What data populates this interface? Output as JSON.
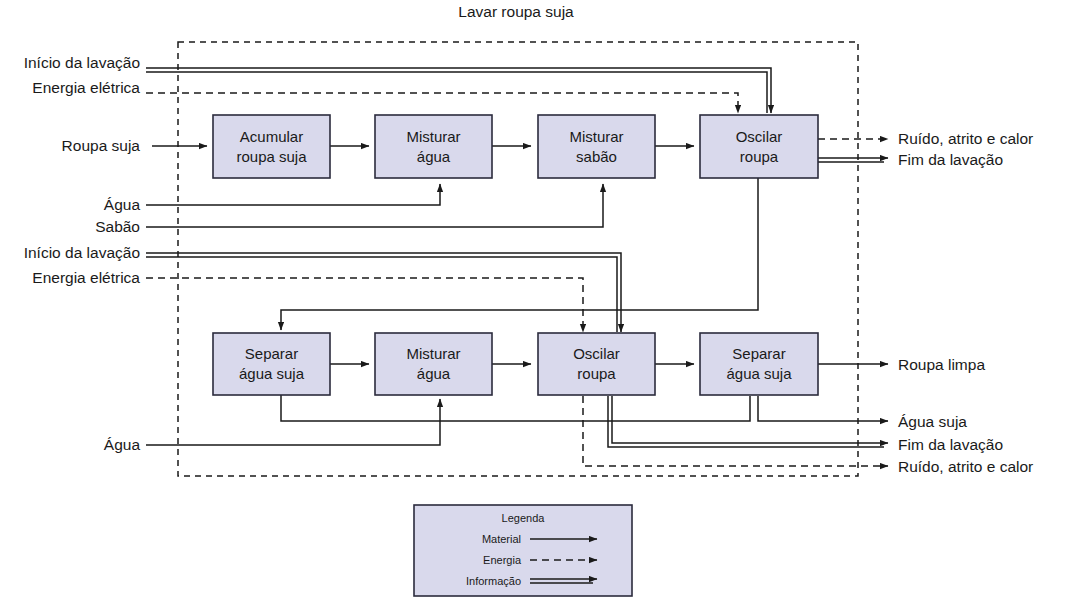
{
  "title": "Lavar roupa suja",
  "colors": {
    "box_fill": "#d9d9ec",
    "box_stroke": "#2b2b3d",
    "line": "#1a1a1a",
    "background": "#ffffff"
  },
  "top_row": {
    "inputs": [
      {
        "label": "Início da lavação",
        "type": "informacao"
      },
      {
        "label": "Energia elétrica",
        "type": "energia"
      },
      {
        "label": "Roupa suja",
        "type": "material"
      },
      {
        "label": "Água",
        "type": "material"
      },
      {
        "label": "Sabão",
        "type": "material"
      }
    ],
    "processes": [
      {
        "line1": "Acumular",
        "line2": "roupa suja"
      },
      {
        "line1": "Misturar",
        "line2": "água"
      },
      {
        "line1": "Misturar",
        "line2": "sabão"
      },
      {
        "line1": "Oscilar",
        "line2": "roupa"
      }
    ],
    "outputs": [
      {
        "label": "Ruído, atrito e calor",
        "type": "energia"
      },
      {
        "label": "Fim da lavação",
        "type": "informacao"
      }
    ]
  },
  "bottom_row": {
    "inputs": [
      {
        "label": "Início da lavação",
        "type": "informacao"
      },
      {
        "label": "Energia elétrica",
        "type": "energia"
      },
      {
        "label": "Água",
        "type": "material"
      }
    ],
    "processes": [
      {
        "line1": "Separar",
        "line2": "água suja"
      },
      {
        "line1": "Misturar",
        "line2": "água"
      },
      {
        "line1": "Oscilar",
        "line2": "roupa"
      },
      {
        "line1": "Separar",
        "line2": "água suja"
      }
    ],
    "outputs": [
      {
        "label": "Roupa limpa",
        "type": "material"
      },
      {
        "label": "Água suja",
        "type": "material"
      },
      {
        "label": "Fim da lavação",
        "type": "informacao"
      },
      {
        "label": "Ruído, atrito e calor",
        "type": "energia"
      }
    ]
  },
  "legend": {
    "title": "Legenda",
    "items": [
      {
        "label": "Material",
        "type": "material"
      },
      {
        "label": "Energia",
        "type": "energia"
      },
      {
        "label": "Informação",
        "type": "informacao"
      }
    ]
  }
}
